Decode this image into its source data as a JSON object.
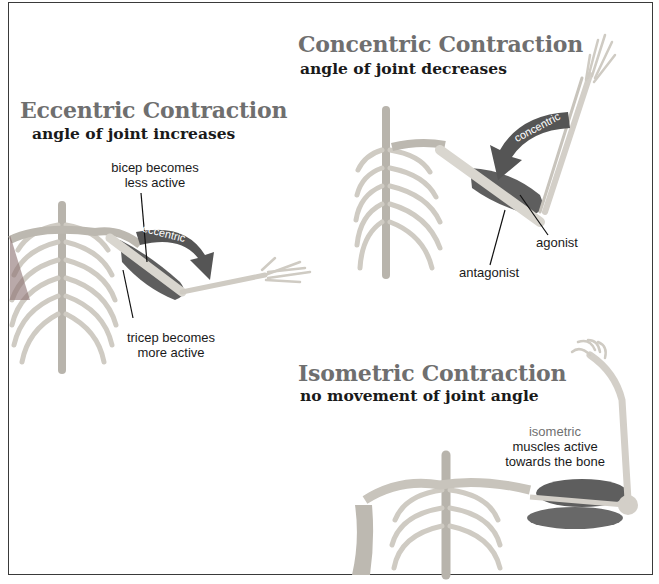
{
  "panels": {
    "eccentric": {
      "title": "Eccentric Contraction",
      "subtitle": "angle of joint increases",
      "arrow_label": "eccentric",
      "annotations": {
        "bicep_line1": "bicep becomes",
        "bicep_line2": "less active",
        "tricep_line1": "tricep becomes",
        "tricep_line2": "more active"
      }
    },
    "concentric": {
      "title": "Concentric Contraction",
      "subtitle": "angle of joint decreases",
      "arrow_label": "concentric",
      "annotations": {
        "agonist": "agonist",
        "antagonist": "antagonist"
      }
    },
    "isometric": {
      "title": "Isometric Contraction",
      "subtitle": "no movement of joint angle",
      "annotations": {
        "label": "isometric",
        "line1": "muscles active",
        "line2": "towards the bone"
      }
    }
  },
  "colors": {
    "frame": "#3a3a3a",
    "title_grey": "#6f6f6f",
    "bone": "#d9d6cf",
    "muscle": "#5e5e5e",
    "arrow": "#555555"
  }
}
